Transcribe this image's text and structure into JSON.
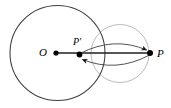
{
  "figure": {
    "type": "geometry-diagram",
    "width": 171,
    "height": 108,
    "background_color": "#ffffff",
    "stroke_color": "#3a3a3a",
    "line_color": "#2b2b2b",
    "point_color": "#000000",
    "labels": {
      "center": "O",
      "inverse_point": "P′",
      "outer_point": "P"
    },
    "shapes": {
      "main_circle": {
        "name": "inversion-circle",
        "center_x": 57.5,
        "center_y": 53,
        "radius": 47.5
      },
      "segment": {
        "name": "ray-O-to-P",
        "x1": 56,
        "y1": 53,
        "x2": 150,
        "y2": 53
      },
      "arc_upper": {
        "name": "arc-Pprime-to-P",
        "from_x": 79,
        "from_y": 53,
        "to_x": 148,
        "to_y": 52,
        "bulge": -13,
        "arrow_at": "P"
      },
      "arc_lower": {
        "name": "arc-P-to-Pprime",
        "from_x": 150,
        "from_y": 54,
        "to_x": 80,
        "to_y": 59,
        "bulge": 14,
        "arrow_at": "P-prime"
      },
      "small_arc": {
        "name": "construction-arc",
        "center_x": 120,
        "center_y": 53,
        "radius": 29
      }
    },
    "points": [
      {
        "id": "O",
        "label": "O",
        "x": 56,
        "y": 53,
        "r": 2.6
      },
      {
        "id": "Pprime",
        "label": "P′",
        "x": 79.5,
        "y": 54.5,
        "r": 2.8
      },
      {
        "id": "P",
        "label": "P",
        "x": 150,
        "y": 53,
        "r": 3.0
      }
    ]
  }
}
